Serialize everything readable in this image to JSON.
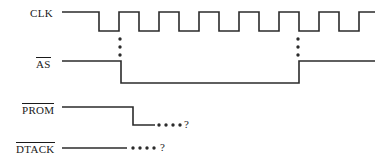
{
  "diagram": {
    "type": "timing-diagram",
    "width": 377,
    "height": 164,
    "background": "#ffffff",
    "line_color": "#2b2b2b",
    "accent_colors": [
      "#3a7a4a",
      "#5a4a8a"
    ],
    "signals": [
      {
        "name": "CLK",
        "label": "CLK",
        "active_low": false,
        "label_x": 30,
        "label_y": 8,
        "high_y": 12,
        "low_y": 31,
        "start_x": 62,
        "end_x": 375,
        "initial_level": "high",
        "description": "Clock with long initial high then 8 pulses of 40px period",
        "transitions": [
          99,
          119,
          139,
          159,
          179,
          199,
          219,
          239,
          259,
          279,
          299,
          319,
          339,
          359
        ]
      },
      {
        "name": "AS",
        "label": "AS",
        "active_low": true,
        "label_x": 36,
        "label_y": 57,
        "high_y": 61,
        "low_y": 83,
        "start_x": 62,
        "end_x": 375,
        "initial_level": "high",
        "assert_x": 121,
        "deassert_x": 299,
        "description": "Address strobe asserted low between clock edges"
      },
      {
        "name": "PROM",
        "label": "PROM",
        "active_low": true,
        "label_x": 22,
        "label_y": 103,
        "high_y": 107,
        "low_y": 125,
        "start_x": 62,
        "end_x": 155,
        "initial_level": "high",
        "assert_x": 133,
        "description": "PROM chip select goes low then unknown (dots)",
        "dots": {
          "x_start": 159,
          "count": 4,
          "spacing": 7,
          "y": 125
        },
        "question": {
          "x": 184,
          "y": 120,
          "text": "?"
        }
      },
      {
        "name": "DTACK",
        "label": "DTACK",
        "active_low": true,
        "label_x": 16,
        "label_y": 142,
        "high_y": 148,
        "low_y": 148,
        "start_x": 62,
        "end_x": 127,
        "initial_level": "high",
        "description": "Data transfer acknowledge line, level unknown (dots)",
        "dots": {
          "x_start": 133,
          "count": 4,
          "spacing": 7,
          "y": 148
        },
        "question": {
          "x": 160,
          "y": 142,
          "text": "?"
        }
      }
    ],
    "ellipses": [
      {
        "name": "left-vertical-ellipsis",
        "x": 120,
        "y_start": 39,
        "count": 3,
        "spacing": 8
      },
      {
        "name": "right-vertical-ellipsis",
        "x": 298,
        "y_start": 39,
        "count": 3,
        "spacing": 8
      }
    ]
  }
}
